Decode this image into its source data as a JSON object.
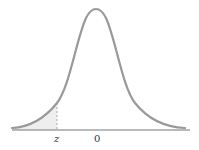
{
  "diagram": {
    "type": "normal-distribution-curve",
    "labels": {
      "z": "z",
      "zero": "0"
    },
    "colors": {
      "curve": "#999999",
      "axis": "#777777",
      "shade": "#eeeeee",
      "dashed_line": "#aaaaaa",
      "text": "#333333"
    }
  }
}
